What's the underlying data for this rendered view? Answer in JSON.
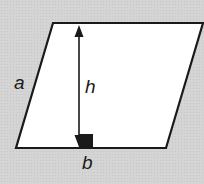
{
  "diagram": {
    "type": "parallelogram-area",
    "colors": {
      "background": "#d3d3d3",
      "shape_fill": "#ffffff",
      "stroke": "#1a1a1a"
    },
    "shape": {
      "vertices": [
        [
          53,
          23
        ],
        [
          203,
          23
        ],
        [
          166,
          148
        ],
        [
          16,
          148
        ]
      ]
    },
    "height_arrow": {
      "x": 79,
      "y_top": 25,
      "y_bottom": 146
    },
    "right_angle_marker": {
      "x": 79,
      "y": 134,
      "size": 14
    },
    "labels": {
      "side": "a",
      "height": "h",
      "base": "b"
    }
  }
}
